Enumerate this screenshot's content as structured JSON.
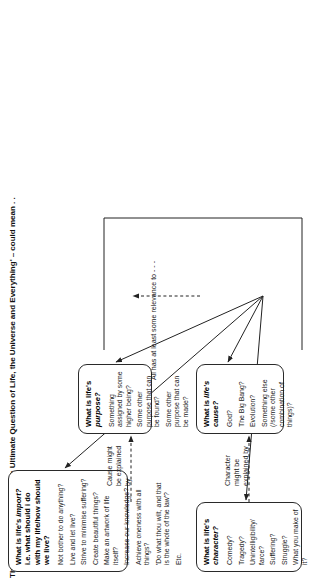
{
  "title": "The Ultimate Question – 'the Ultimate Question of Life, the Universe and Everything' – could mean . .",
  "nodes": {
    "character": {
      "title": "What is life's character?",
      "title_plain": "What is life's ",
      "title_em": "character?",
      "items": [
        "Comedy?",
        "Tragedy?",
        "Unintelligibility/ farce?",
        "Suffering?",
        "Struggle?",
        "What you make of it?"
      ]
    },
    "cause": {
      "title": "What is life's cause?",
      "title_plain": "What is ",
      "title_em": "life's cause?",
      "items": [
        "God?",
        "The Big Bang?",
        "Evolution?",
        "Something else (/some other combination of things)?"
      ]
    },
    "purpose": {
      "title": "What is life's purpose?",
      "title_plain": "What is life's ",
      "title_em": "purpose?",
      "items": [
        "Something assigned by some higher being?",
        "Some other purpose that can be found?",
        "Some other purpose that can be made?"
      ]
    },
    "import": {
      "title": "What is life's import? i.e. what should i do with my life/how should we live?",
      "title_pre": "What is life's ",
      "title_em": "import?",
      "title_post": " i.e. what should i do with my life/how should we live?",
      "items": [
        "Not bother to do anything?",
        "Live and let live?",
        "Strive to minimise suffering?",
        "Create beautiful things?",
        "Make an artwork of life itself?",
        "Increase our knowledge?",
        "Achieve oneness with all things?",
        "'Do what thou wilt, and that is the whole of the law'?",
        "Etc."
      ]
    }
  },
  "edge_labels": {
    "character_explained": "Character might be explained by",
    "cause_explained": "Cause might be explained by",
    "relevance": "All has at least some relevance to - - -"
  },
  "colors": {
    "ink": "#1a1a1a",
    "stroke": "#2a2a2a",
    "background": "#ffffff"
  }
}
